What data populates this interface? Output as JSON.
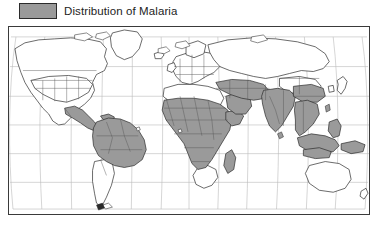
{
  "legend": {
    "label": "Distribution of Malaria",
    "swatch_color": "#9a9a9a",
    "swatch_border_color": "#2b2b2b"
  },
  "map": {
    "title": "Distribution of Malaria",
    "projection": "robinson",
    "frame_border_color": "#3a3a3a",
    "ocean_color": "#ffffff",
    "land_outline_color": "#2a2a2a",
    "country_border_color": "#555555",
    "graticule_color": "#b9b9b9",
    "endemic_fill_color": "#9a9a9a",
    "non_endemic_fill_color": "#ffffff",
    "graticule_spacing_degrees": 30,
    "lon_range": [
      -180,
      180
    ],
    "lat_range": [
      -60,
      85
    ],
    "endemic_regions": [
      "Central America",
      "Mexico (south)",
      "Colombia",
      "Venezuela",
      "Guyana",
      "Suriname",
      "French Guiana",
      "Ecuador",
      "Peru",
      "Bolivia",
      "Brazil (Amazon)",
      "Paraguay",
      "Sub-Saharan Africa",
      "West Africa",
      "Central Africa",
      "East Africa",
      "Madagascar",
      "Sudan",
      "Ethiopia",
      "Somalia",
      "Arabian Peninsula (south)",
      "Iran",
      "Iraq",
      "Afghanistan",
      "Pakistan",
      "India",
      "Nepal",
      "Bangladesh",
      "Myanmar",
      "Thailand",
      "Laos",
      "Cambodia",
      "Vietnam",
      "Malaysia",
      "Indonesia",
      "Philippines",
      "Papua New Guinea",
      "Southern China",
      "Turkey (southeast)"
    ],
    "non_endemic_regions": [
      "Canada",
      "United States",
      "Greenland",
      "Europe",
      "Russia",
      "North Africa (Sahara)",
      "South Africa",
      "Argentina",
      "Chile",
      "Uruguay",
      "Australia",
      "New Zealand",
      "Japan",
      "Korea",
      "Northern China",
      "Mongolia"
    ]
  }
}
